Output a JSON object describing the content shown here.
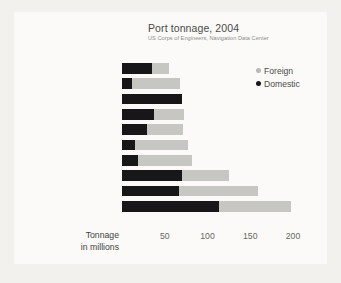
{
  "chart_data": {
    "type": "bar",
    "orientation": "horizontal",
    "stacked": true,
    "title": "Port tonnage, 2004",
    "subtitle": "US Corps of Engineers, Navigation Data Center",
    "xlabel_lines": [
      "Tonnage",
      "in millions"
    ],
    "ylabel": "",
    "xlim": [
      0,
      210
    ],
    "ticks": [
      50,
      100,
      150,
      200
    ],
    "tick_labels": [
      "50",
      "100",
      "150",
      "200"
    ],
    "grid": false,
    "legend_position": "top-right",
    "categories": [
      "Baton Rouge, LA",
      "Texas City, TX",
      "Huntington-Tri-state",
      "New Orleans, LA",
      "Corpus Christi, TX",
      "Long Beach, CA",
      "Beaumont, TX",
      "New York, NY & NJ",
      "Houston, TX",
      "South Louisiana, LA"
    ],
    "category_styles": [
      "normal",
      "italic",
      "normal",
      "normal",
      "italic",
      "normal",
      "italic",
      "normal",
      "italic",
      "normal"
    ],
    "series": [
      {
        "name": "Domestic",
        "color": "#17171a",
        "values": [
          35,
          12,
          70,
          38,
          29,
          15,
          19,
          70,
          67,
          113
        ]
      },
      {
        "name": "Foreign",
        "color": "#c6c6c3",
        "values": [
          20,
          56,
          0,
          34,
          42,
          62,
          63,
          55,
          92,
          85
        ]
      }
    ],
    "totals": [
      55,
      68,
      70,
      72,
      71,
      77,
      82,
      125,
      159,
      198
    ]
  },
  "legend": {
    "items": [
      {
        "label": "Foreign",
        "marker": "dot-grey"
      },
      {
        "label": "Domestic",
        "marker": "dot-black"
      }
    ]
  },
  "colors": {
    "domestic": "#17171a",
    "foreign": "#c6c6c3",
    "background": "#fbfaf8",
    "page": "#f2f1ee",
    "text": "#3f3f3e",
    "muted": "#8d8c89"
  }
}
